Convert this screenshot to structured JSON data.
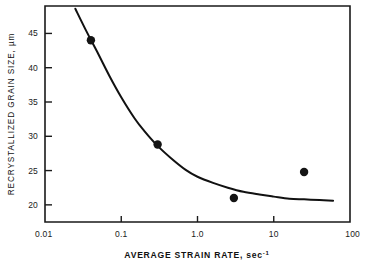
{
  "chart_data": {
    "type": "scatter",
    "title": "",
    "xlabel": "AVERAGE STRAIN RATE, sec",
    "xlabel_exponent": "-1",
    "ylabel": "RECRYSTALLIZED GRAIN SIZE, µm",
    "xscale": "log",
    "yscale": "linear",
    "xlim": [
      0.01,
      100
    ],
    "ylim": [
      17.5,
      49.0
    ],
    "grid": false,
    "legend": null,
    "xticks": [
      0.01,
      0.1,
      1.0,
      10,
      100
    ],
    "xticklabels": [
      "0.01",
      "0.1",
      "1.0",
      "10",
      "100"
    ],
    "yticks": [
      20,
      25,
      30,
      35,
      40,
      45
    ],
    "yticklabels": [
      "20",
      "25",
      "30",
      "35",
      "40",
      "45"
    ],
    "points": [
      {
        "x": 0.04,
        "y": 44.0
      },
      {
        "x": 0.3,
        "y": 28.8
      },
      {
        "x": 3.0,
        "y": 21.0
      },
      {
        "x": 25.0,
        "y": 24.8
      }
    ],
    "series": [
      {
        "name": "fitted curve",
        "x": [
          0.025,
          0.035,
          0.05,
          0.07,
          0.1,
          0.15,
          0.2,
          0.3,
          0.45,
          0.7,
          1.0,
          1.6,
          2.5,
          4.0,
          6.5,
          10.0,
          16.0,
          25.0,
          40.0,
          60.0
        ],
        "y": [
          48.6,
          45.3,
          42.0,
          38.8,
          35.7,
          32.6,
          30.8,
          28.6,
          26.8,
          25.1,
          24.1,
          23.2,
          22.5,
          21.9,
          21.5,
          21.2,
          20.9,
          20.8,
          20.7,
          20.6
        ]
      }
    ]
  },
  "annotations": {
    "point_labels": [
      "44",
      "28.8",
      "21",
      "24.8"
    ]
  }
}
